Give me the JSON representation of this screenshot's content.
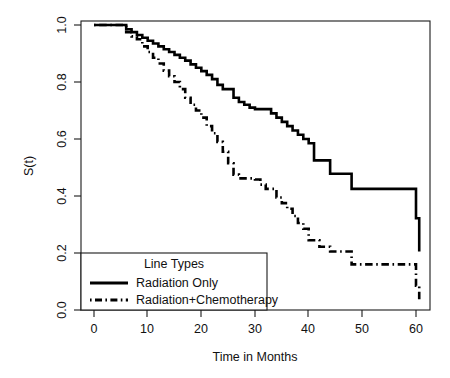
{
  "chart_data": {
    "type": "line",
    "title": "",
    "subtitle": "",
    "xlabel": "Time in Months",
    "ylabel": "S(t)",
    "xlim": [
      0,
      62
    ],
    "ylim": [
      0,
      1.0
    ],
    "xticks": [
      0,
      10,
      20,
      30,
      40,
      50,
      60
    ],
    "xticklabels": [
      "0",
      "10",
      "20",
      "30",
      "40",
      "50",
      "60"
    ],
    "yticks": [
      0.0,
      0.2,
      0.4,
      0.6,
      0.8,
      1.0
    ],
    "yticklabels": [
      "0.0",
      "0.2",
      "0.4",
      "0.6",
      "0.8",
      "1.0"
    ],
    "grid": false,
    "step_type": "kaplan-meier",
    "legend": {
      "position": "bottom-left",
      "title": "Line Types",
      "entries": [
        {
          "label": "Radiation Only",
          "linestyle": "solid"
        },
        {
          "label": "Radiation+Chemotherapy",
          "linestyle": "dashdot"
        }
      ]
    },
    "series": [
      {
        "name": "Radiation Only",
        "linestyle": "solid",
        "x": [
          0,
          5,
          6,
          7,
          8,
          9,
          10,
          11,
          12,
          13,
          14,
          15,
          16,
          17,
          18,
          19,
          20,
          21,
          22,
          23,
          24,
          26,
          27,
          28,
          29,
          30,
          31,
          32,
          33,
          34,
          35,
          36,
          37,
          38,
          39,
          40,
          41,
          44,
          48,
          60,
          60.6
        ],
        "y": [
          1.0,
          1.0,
          0.985,
          0.975,
          0.965,
          0.955,
          0.945,
          0.935,
          0.925,
          0.915,
          0.905,
          0.895,
          0.885,
          0.875,
          0.862,
          0.85,
          0.838,
          0.825,
          0.81,
          0.79,
          0.775,
          0.745,
          0.73,
          0.72,
          0.71,
          0.705,
          0.705,
          0.705,
          0.69,
          0.675,
          0.66,
          0.645,
          0.63,
          0.615,
          0.6,
          0.585,
          0.525,
          0.478,
          0.425,
          0.322,
          0.205
        ]
      },
      {
        "name": "Radiation+Chemotherapy",
        "linestyle": "dashdot",
        "x": [
          0,
          5,
          6,
          7,
          8,
          9,
          10,
          11,
          12,
          13,
          14,
          15,
          16,
          17,
          18,
          19,
          20,
          21,
          22,
          23,
          24,
          25,
          26,
          27,
          30,
          31,
          32,
          33,
          34,
          35,
          36,
          37,
          38,
          39,
          40,
          42,
          44,
          46,
          48,
          60,
          60.6
        ],
        "y": [
          1.0,
          1.0,
          0.975,
          0.96,
          0.95,
          0.925,
          0.905,
          0.885,
          0.865,
          0.84,
          0.82,
          0.8,
          0.775,
          0.745,
          0.72,
          0.7,
          0.675,
          0.645,
          0.62,
          0.59,
          0.555,
          0.515,
          0.475,
          0.462,
          0.458,
          0.44,
          0.425,
          0.425,
          0.395,
          0.375,
          0.355,
          0.33,
          0.305,
          0.285,
          0.245,
          0.222,
          0.205,
          0.205,
          0.16,
          0.085,
          0.032
        ]
      }
    ],
    "annotations": []
  },
  "axes": {
    "ylabel_text": "S(t)",
    "xlabel_text": "Time in Months"
  }
}
